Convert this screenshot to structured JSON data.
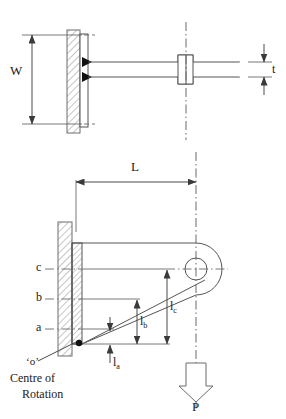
{
  "figure": {
    "type": "engineering-drawing",
    "line_color": "#555555",
    "hatch_color": "#888888",
    "text_color": "#1a1a1a",
    "background": "#ffffff"
  },
  "top_view": {
    "name": "top-view",
    "dimensions": {
      "width_label": "W",
      "thickness_label": "t"
    }
  },
  "side_view": {
    "name": "side-view",
    "dimensions": {
      "length_label": "L",
      "la_base": "l",
      "la_sub": "a",
      "lb_base": "l",
      "lb_sub": "b",
      "lc_base": "l",
      "lc_sub": "c"
    },
    "weld_rows": [
      {
        "label": "c"
      },
      {
        "label": "b"
      },
      {
        "label": "a"
      }
    ],
    "rotation_point": {
      "marker": "‘o’",
      "caption_line1": "Centre of",
      "caption_line2": "Rotation"
    },
    "load": {
      "label": "P"
    }
  }
}
